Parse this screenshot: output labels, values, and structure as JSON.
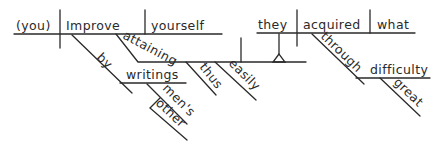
{
  "diagram": {
    "type": "sentence-diagram",
    "words": {
      "subject": "(you)",
      "verb": "Improve",
      "object": "yourself",
      "participle": "attaining",
      "prep_by": "by",
      "writings": "writings",
      "mens": "men's",
      "other": "other",
      "thus": "thus",
      "easily": "easily",
      "clause_subject": "they",
      "clause_verb": "acquired",
      "clause_object": "what",
      "prep_through": "through",
      "difficulty": "difficulty",
      "great": "great"
    },
    "colors": {
      "ink": "#2a2a2a",
      "background": "#ffffff"
    }
  }
}
